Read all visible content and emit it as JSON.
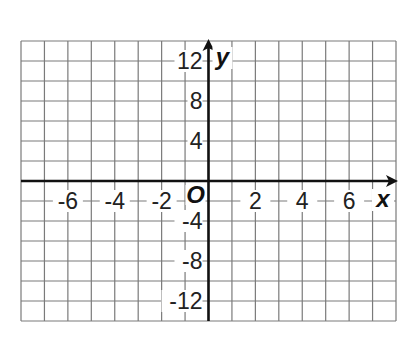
{
  "chart_data": {
    "type": "coordinate-grid",
    "title": "",
    "xlabel": "x",
    "ylabel": "y",
    "origin_label": "O",
    "xlim": [
      -8,
      8
    ],
    "ylim": [
      -14,
      14
    ],
    "x_grid_step": 1,
    "y_grid_step": 2,
    "grid": true,
    "x_ticks": [
      -6,
      -4,
      -2,
      2,
      4,
      6
    ],
    "x_tick_labels": [
      "-6",
      "-4",
      "-2",
      "2",
      "4",
      "6"
    ],
    "y_ticks": [
      12,
      8,
      4,
      -4,
      -8,
      -12
    ],
    "y_tick_labels": [
      "12",
      "8",
      "4",
      "-4",
      "-8",
      "-12"
    ],
    "series": []
  },
  "colors": {
    "grid": "#7a7a7a",
    "axis": "#111111",
    "background": "#ffffff"
  },
  "layout": {
    "left": 21,
    "right": 396,
    "top": 41,
    "bottom": 321,
    "axis_x_px": 209,
    "axis_y_px": 180
  }
}
